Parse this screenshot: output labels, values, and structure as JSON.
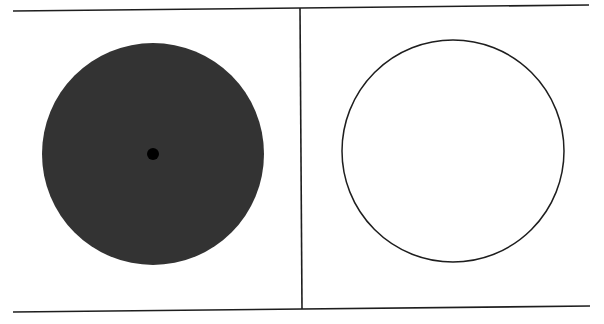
{
  "diagram": {
    "background": "#ffffff",
    "frame": {
      "stroke": "#1e1e1e",
      "stroke_width": 1.6,
      "top_line": {
        "x1": 13,
        "y1": 11,
        "x2": 589,
        "y2": 5
      },
      "bottom_line": {
        "x1": 13,
        "y1": 312,
        "x2": 590,
        "y2": 306
      },
      "divider_line": {
        "x1": 300,
        "y1": 8,
        "x2": 302,
        "y2": 309
      }
    },
    "panels": [
      {
        "name": "left-panel",
        "circle": {
          "cx": 153,
          "cy": 154,
          "r": 111,
          "fill": "#333333",
          "stroke": "none"
        },
        "center_dot": {
          "cx": 153,
          "cy": 154,
          "r": 6,
          "fill": "#000000"
        }
      },
      {
        "name": "right-panel",
        "circle": {
          "cx": 453,
          "cy": 151,
          "r": 111,
          "fill": "#ffffff",
          "stroke": "#1e1e1e",
          "stroke_width": 1.5
        }
      }
    ]
  }
}
